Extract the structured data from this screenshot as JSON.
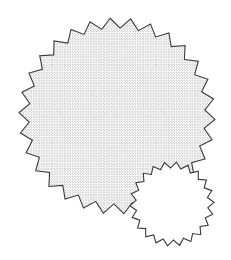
{
  "canvas": {
    "width": 231,
    "height": 260,
    "background_color": "#ffffff"
  },
  "figure": {
    "stroke_color": "#3a3a3a",
    "stroke_width": 1.1,
    "stipple_dot_color": "#555555",
    "stipple_spacing": 2.6,
    "stipple_dot_radius": 0.42
  },
  "shapes": [
    {
      "name": "large-starburst",
      "label": "Large stippled starburst",
      "center_x": 117,
      "center_y": 116,
      "outer_radius": 98,
      "inner_radius": 88,
      "teeth": 30,
      "rotation_deg": -4,
      "fill": "stipple",
      "fill_color": "#ffffff",
      "stroke_color": "#3a3a3a"
    },
    {
      "name": "small-starburst",
      "label": "Small unfilled starburst",
      "center_x": 172,
      "center_y": 204,
      "outer_radius": 42,
      "inner_radius": 36,
      "teeth": 22,
      "rotation_deg": 6,
      "fill": "solid",
      "fill_color": "#ffffff",
      "stroke_color": "#3a3a3a"
    }
  ]
}
